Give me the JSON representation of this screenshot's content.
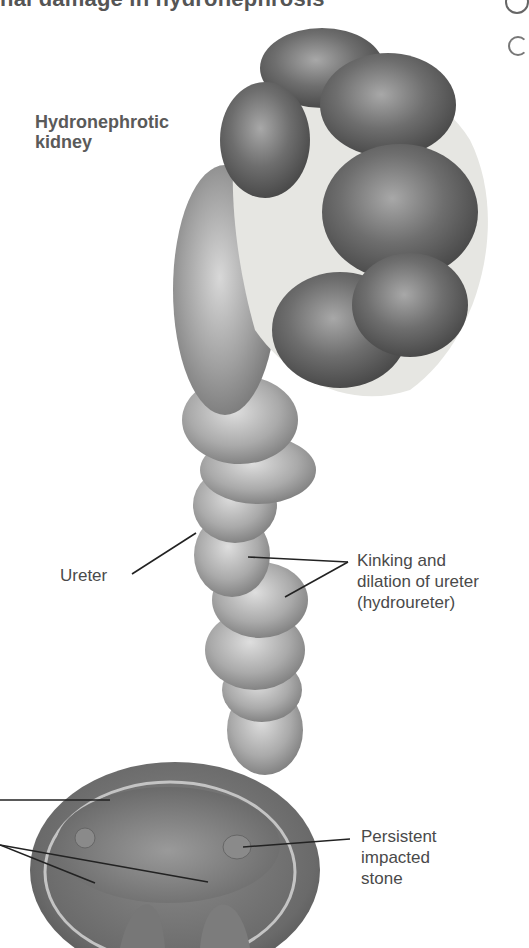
{
  "figure": {
    "title_partial": "nal damage in hydronephrosis",
    "labels": {
      "kidney": [
        "Hydronephrotic",
        "kidney"
      ],
      "ureter": "Ureter",
      "kinking": [
        "Kinking and",
        "dilation of ureter",
        "(hydroureter)"
      ],
      "stone": [
        "Persistent",
        "impacted",
        "stone"
      ]
    },
    "colors": {
      "background": "#ffffff",
      "label_text": "#4a4a4a",
      "leader_line": "#222222",
      "tissue_dark": "#5e5e5e",
      "tissue_mid": "#8c8c8c",
      "tissue_light": "#c8c8c8",
      "fat": "#e6e6e2"
    }
  }
}
